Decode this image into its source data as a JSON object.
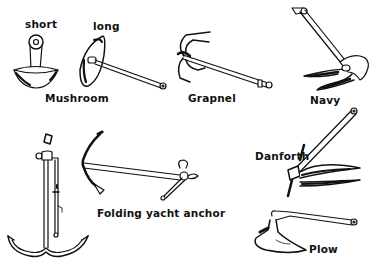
{
  "figure": {
    "labels": {
      "short": "short",
      "long": "long",
      "mushroom": "Mushroom",
      "grapnel": "Grapnel",
      "navy": "Navy",
      "folding_yacht": "Folding yacht anchor",
      "danforth": "Danforth",
      "plow": "Plow"
    },
    "items": [
      {
        "name": "Mushroom (short)",
        "group": "Mushroom"
      },
      {
        "name": "Mushroom (long)",
        "group": "Mushroom"
      },
      {
        "name": "Grapnel"
      },
      {
        "name": "Navy"
      },
      {
        "name": "Kedge / Admiralty"
      },
      {
        "name": "Folding yacht anchor"
      },
      {
        "name": "Danforth"
      },
      {
        "name": "Plow"
      }
    ],
    "colors": {
      "ink": "#111111",
      "background": "#ffffff"
    }
  }
}
